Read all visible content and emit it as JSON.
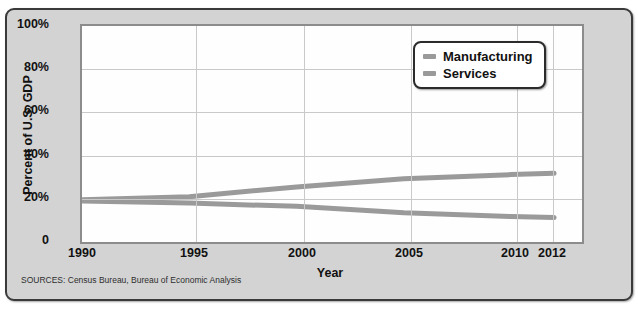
{
  "figure": {
    "title": "",
    "sources": "SOURCES: Census Bureau, Bureau of Economic Analysis",
    "background_color": "#d3d3d3",
    "plot_background_color": "#fefefe",
    "border_color": "#3a3a3a"
  },
  "legend": {
    "position": "top-right-inside",
    "entries": [
      {
        "label": "Manufacturing",
        "color": "#9a9a9a"
      },
      {
        "label": "Services",
        "color": "#9a9a9a"
      }
    ]
  },
  "chart_data": {
    "type": "line",
    "title": "",
    "xlabel": "Year",
    "ylabel": "Percent of U.S. GDP",
    "xlim": [
      1990,
      2013.3
    ],
    "ylim": [
      0,
      100
    ],
    "xticks": [
      1990,
      1995,
      2000,
      2005,
      2010,
      2012
    ],
    "xtick_labels": [
      "1990",
      "1995",
      "2000",
      "2005",
      "2010",
      "2012"
    ],
    "yticks": [
      0,
      20,
      40,
      60,
      80,
      100
    ],
    "ytick_labels": [
      "0",
      "20%",
      "40%",
      "60%",
      "80%",
      "100%"
    ],
    "grid": true,
    "x": [
      1990,
      1995,
      2000,
      2005,
      2010,
      2012
    ],
    "series": [
      {
        "name": "Manufacturing",
        "color": "#9a9a9a",
        "values": [
          19.0,
          18.0,
          16.5,
          13.5,
          11.8,
          11.3
        ]
      },
      {
        "name": "Services",
        "color": "#9a9a9a",
        "values": [
          19.6,
          21.0,
          25.5,
          29.3,
          31.2,
          31.8
        ]
      }
    ]
  }
}
